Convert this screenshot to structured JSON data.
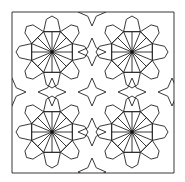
{
  "image": {
    "title": "Islamic geometric tiling pattern",
    "description": "Black line-art tessellation of 8-fold rosettes and 4-point stars inside a square frame",
    "stroke_color": "#222222",
    "background_color": "#ffffff",
    "frame": {
      "x": 12,
      "y": 12,
      "width": 162,
      "height": 161
    },
    "rosette_centers": [
      [
        52,
        52
      ],
      [
        132,
        52
      ],
      [
        52,
        132
      ],
      [
        132,
        132
      ]
    ],
    "star_centers": [
      [
        92,
        52
      ],
      [
        52,
        92
      ],
      [
        132,
        92
      ],
      [
        92,
        132
      ],
      [
        92,
        92
      ],
      [
        92,
        12
      ],
      [
        12,
        92
      ],
      [
        172,
        92
      ],
      [
        92,
        172
      ]
    ]
  }
}
